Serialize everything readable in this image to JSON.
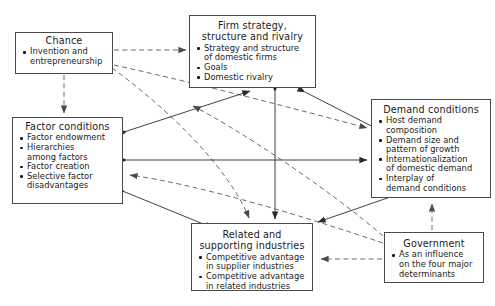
{
  "diagram": {
    "style": {
      "box_border_color": "#4a4a4a",
      "text_color": "#1a1a1a",
      "background_color": "#ffffff",
      "solid_edge_color": "#333333",
      "dashed_edge_color": "#666666"
    },
    "nodes": [
      {
        "id": "chance",
        "title": "Chance",
        "bullets": [
          "Invention and\nentrepreneurship"
        ]
      },
      {
        "id": "factor_conditions",
        "title": "Factor conditions",
        "bullets": [
          "Factor endowment",
          "Hierarchies\namong factors",
          "Factor creation",
          "Selective factor\ndisadvantages"
        ]
      },
      {
        "id": "firm_strategy",
        "title": "Firm strategy,\nstructure and rivalry",
        "bullets": [
          "Strategy and structure\nof domestic firms",
          "Goals",
          "Domestic rivalry"
        ]
      },
      {
        "id": "demand_conditions",
        "title": "Demand conditions",
        "bullets": [
          "Host demand\ncomposition",
          "Demand size and\npattern of growth",
          "Internationalization\nof domestic demand",
          "Interplay of\ndemand conditions"
        ]
      },
      {
        "id": "related_supporting",
        "title": "Related and\nsupporting industries",
        "bullets": [
          "Competitive advantage\nin supplier industries",
          "Competitive advantage\nin related industries"
        ]
      },
      {
        "id": "government",
        "title": "Government",
        "bullets": [
          "As an influence\non the four major\ndeterminants"
        ]
      }
    ],
    "edges": [
      {
        "from": "chance",
        "to": "firm_strategy",
        "style": "dashed",
        "heads": "to"
      },
      {
        "from": "chance",
        "to": "factor_conditions",
        "style": "dashed",
        "heads": "to"
      },
      {
        "from": "chance",
        "to": "demand_conditions",
        "style": "dashed",
        "heads": "to"
      },
      {
        "from": "chance",
        "to": "related_supporting",
        "style": "dashed",
        "heads": "to"
      },
      {
        "from": "factor_conditions",
        "to": "firm_strategy",
        "style": "solid",
        "heads": "both"
      },
      {
        "from": "factor_conditions",
        "to": "demand_conditions",
        "style": "solid",
        "heads": "both"
      },
      {
        "from": "factor_conditions",
        "to": "related_supporting",
        "style": "solid",
        "heads": "both"
      },
      {
        "from": "firm_strategy",
        "to": "demand_conditions",
        "style": "solid",
        "heads": "both"
      },
      {
        "from": "firm_strategy",
        "to": "related_supporting",
        "style": "solid",
        "heads": "both"
      },
      {
        "from": "demand_conditions",
        "to": "related_supporting",
        "style": "solid",
        "heads": "both"
      },
      {
        "from": "government",
        "to": "firm_strategy",
        "style": "dashed",
        "heads": "to"
      },
      {
        "from": "government",
        "to": "demand_conditions",
        "style": "dashed",
        "heads": "to"
      },
      {
        "from": "government",
        "to": "factor_conditions",
        "style": "dashed",
        "heads": "to"
      },
      {
        "from": "government",
        "to": "related_supporting",
        "style": "dashed",
        "heads": "to"
      }
    ]
  }
}
